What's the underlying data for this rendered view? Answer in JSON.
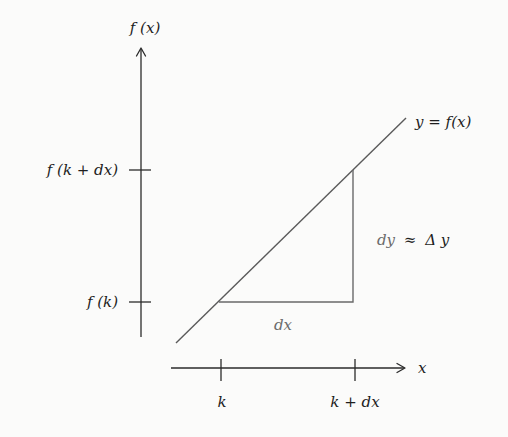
{
  "diagram": {
    "title": "",
    "y_axis": {
      "label": "f (x)",
      "ticks": [
        {
          "label": "f (k + dx)",
          "y": 170
        },
        {
          "label": "f (k)",
          "y": 302
        }
      ]
    },
    "x_axis": {
      "label": "x",
      "ticks": [
        {
          "label": "k",
          "x": 221
        },
        {
          "label": "k + dx",
          "x": 355
        }
      ]
    },
    "curve": {
      "label": "y = f(x)",
      "type": "line"
    },
    "triangle": {
      "run_label": "dx",
      "rise_label": {
        "left": "dy",
        "approx": "≈",
        "right": "Δ y"
      }
    },
    "colors": {
      "background": "#fbfbfa",
      "axis": "#2b2b2b",
      "curve": "#5a5a5a",
      "muted_text": "#6b6b6b"
    }
  }
}
